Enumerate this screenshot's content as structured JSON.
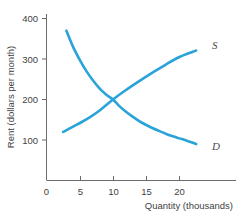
{
  "chart_data": {
    "type": "line",
    "title": "",
    "xlabel": "Quantity (thousands)",
    "ylabel": "Rent (dollars per month)",
    "xlim": [
      0,
      23.5
    ],
    "ylim": [
      0,
      430
    ],
    "xticks": [
      0,
      5,
      10,
      15,
      20
    ],
    "xtick_labels": [
      "0",
      "5",
      "10",
      "15",
      "20"
    ],
    "yticks": [
      100,
      200,
      300,
      400
    ],
    "ytick_labels": [
      "100",
      "200",
      "300",
      "400"
    ],
    "origin_label": "0",
    "grid": false,
    "legend": "inline-endpoint-labels",
    "accent_color": "#29a3d8",
    "axis_color": "#6b6b6b",
    "series": [
      {
        "name": "Demand",
        "label": "D",
        "color": "#29a3d8",
        "x": [
          3,
          4,
          5,
          6,
          7,
          8,
          9,
          10,
          11,
          12,
          13,
          14,
          15,
          16,
          17,
          18,
          19,
          20,
          21,
          22,
          22.5
        ],
        "y": [
          370,
          330,
          298,
          270,
          247,
          227,
          212,
          200,
          183,
          169,
          157,
          146,
          137,
          129,
          122,
          115,
          109,
          104,
          99,
          93,
          90
        ]
      },
      {
        "name": "Supply",
        "label": "S",
        "color": "#29a3d8",
        "x": [
          2.5,
          4,
          6,
          8,
          10,
          12,
          14,
          16,
          18,
          20,
          22,
          22.5
        ],
        "y": [
          120,
          133,
          151,
          173,
          200,
          224,
          246,
          267,
          287,
          305,
          318,
          321
        ]
      }
    ],
    "equilibrium": {
      "quantity": 10,
      "rent": 200
    }
  },
  "curve_labels": {
    "supply": "S",
    "demand": "D"
  },
  "ticks": {
    "x": [
      "0",
      "5",
      "10",
      "15",
      "20"
    ],
    "y": [
      "100",
      "200",
      "300",
      "400"
    ]
  },
  "axis_titles": {
    "x": "Quantity (thousands)",
    "y": "Rent (dollars per month)"
  }
}
